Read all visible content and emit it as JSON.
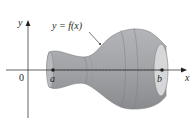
{
  "figure": {
    "type": "solid-of-revolution",
    "curve_label": "y = f(x)",
    "origin_label": "0",
    "x_axis_label": "x",
    "y_axis_label": "y",
    "interval_start_label": "a",
    "interval_end_label": "b",
    "colors": {
      "solid_fill": "#a7a9ac",
      "solid_dark": "#8a8c8f",
      "end_cap_fill": "#d6d7d9",
      "axis": "#231f20",
      "text": "#231f20"
    }
  }
}
